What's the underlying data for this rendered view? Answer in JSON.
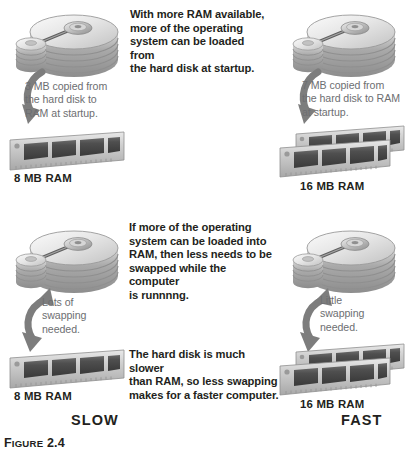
{
  "figure": {
    "caption_prefix": "F",
    "caption_small": "IGURE",
    "caption_number": "2.4"
  },
  "colors": {
    "text": "#231f20",
    "callout_text": "#6d6e71",
    "background": "#ffffff",
    "metal_light": "#e3e3e3",
    "metal_mid": "#b8b8b8",
    "metal_dark": "#8a8a8a",
    "chip_dark": "#4a4a4a",
    "arrow": "#7a7a7a"
  },
  "panels": [
    {
      "id": "top-left",
      "disk_label": "hard-disk-platters",
      "callout": "3 MB copied from\nthe hard disk to\nRAM at startup.",
      "callout_lines": [
        "3 MB copied from",
        "the hard disk to",
        "RAM at startup."
      ],
      "arrow_direction": "disk-to-ram",
      "ram_label": "8 MB RAM",
      "ram_modules": 1
    },
    {
      "id": "top-right",
      "disk_label": "hard-disk-platters",
      "callout_lines": [
        "7 MB copied from",
        "the hard disk to RAM",
        "at startup."
      ],
      "arrow_direction": "disk-to-ram",
      "ram_label": "16 MB RAM",
      "ram_modules": 2
    },
    {
      "id": "bottom-left",
      "disk_label": "hard-disk-platters",
      "callout_lines": [
        "Lots of",
        "swapping",
        "needed."
      ],
      "arrow_direction": "bidirectional-swap",
      "ram_label": "8 MB RAM",
      "ram_modules": 1
    },
    {
      "id": "bottom-right",
      "disk_label": "hard-disk-platters",
      "callout_lines": [
        "Little",
        "swapping",
        "needed."
      ],
      "arrow_direction": "bidirectional-swap",
      "ram_label": "16 MB RAM",
      "ram_modules": 2
    }
  ],
  "explanations": [
    {
      "id": "top-center",
      "lines": [
        "With more RAM available,",
        "more of the operating",
        "system can be loaded from",
        "the hard disk at startup."
      ]
    },
    {
      "id": "middle-center",
      "lines": [
        "If more of the operating",
        "system can be loaded into",
        "RAM, then less needs to be",
        "swapped while the computer",
        "is runnnng."
      ]
    },
    {
      "id": "lower-center",
      "lines": [
        "The hard disk is much slower",
        "than RAM, so less swapping",
        "makes for a faster computer."
      ]
    }
  ],
  "verdicts": {
    "left": "SLOW",
    "right": "FAST"
  }
}
